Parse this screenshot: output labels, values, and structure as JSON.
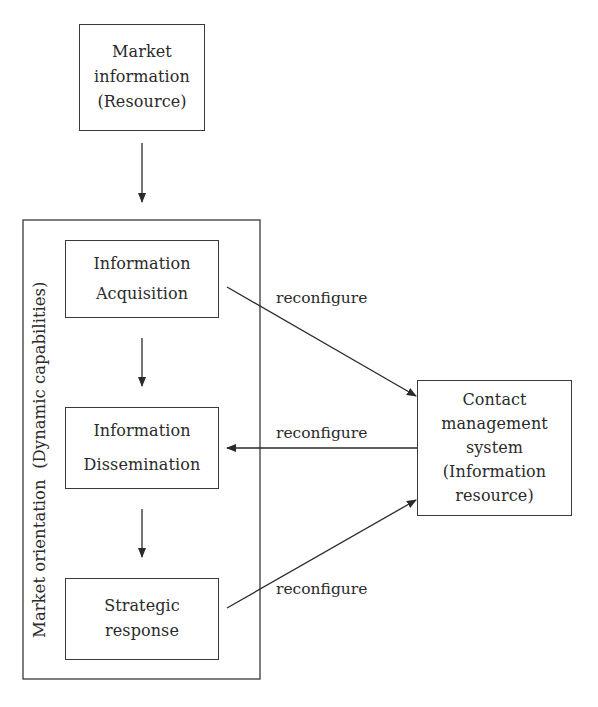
{
  "diagram": {
    "nodes": {
      "market_info": {
        "lines": [
          "Market",
          "information",
          "(Resource)"
        ]
      },
      "acquisition": {
        "lines": [
          "Information",
          "Acquisition"
        ]
      },
      "dissemination": {
        "lines": [
          "Information",
          "Dissemination"
        ]
      },
      "strategic": {
        "lines": [
          "Strategic",
          "response"
        ]
      },
      "contact": {
        "lines": [
          "Contact",
          "management",
          "system",
          "(Information",
          "resource)"
        ]
      }
    },
    "group": {
      "label": "Market orientation  (Dynamic capabilities)"
    },
    "edges": [
      {
        "from": "market_info",
        "to": "acquisition",
        "label": ""
      },
      {
        "from": "acquisition",
        "to": "dissemination",
        "label": ""
      },
      {
        "from": "dissemination",
        "to": "strategic",
        "label": ""
      },
      {
        "from": "acquisition",
        "to": "contact",
        "label": "reconfigure"
      },
      {
        "from": "contact",
        "to": "dissemination",
        "label": "reconfigure"
      },
      {
        "from": "strategic",
        "to": "contact",
        "label": "reconfigure"
      }
    ],
    "colors": {
      "line": "#2a2a2a",
      "background": "#ffffff"
    }
  }
}
